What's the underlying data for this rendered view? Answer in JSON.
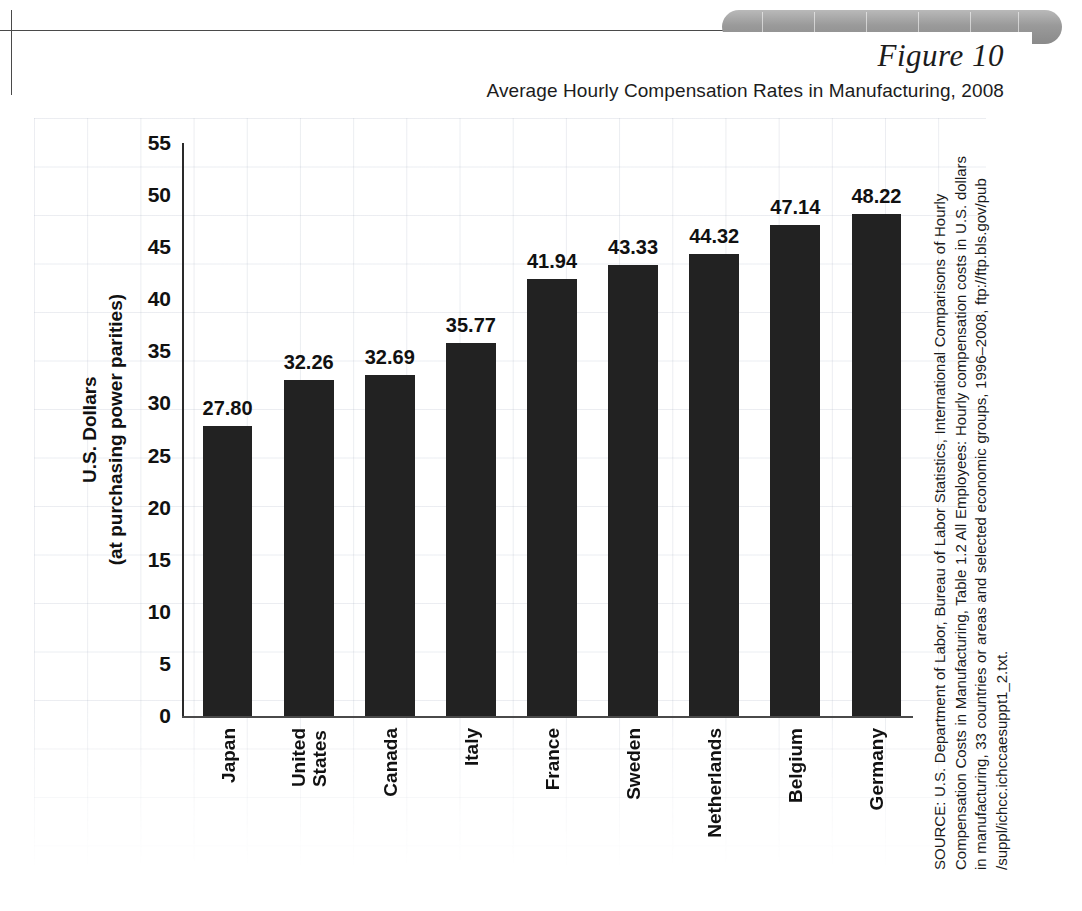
{
  "figure": {
    "label": "Figure 10",
    "title": "Average Hourly Compensation Rates in Manufacturing, 2008"
  },
  "source": {
    "text": "SOURCE: U.S. Department of Labor, Bureau of Labor Statistics, International Comparisons of Hourly Compensation Costs in Manufacturing, Table 1.2 All Employees: Hourly compensation costs in U.S. dollars in manufacturing, 33 countries or areas and selected economic groups, 1996–2008, ftp://ftp.bls.gov/pub /suppl/ichcc.ichccaesuppt1_2.txt."
  },
  "colors": {
    "bar": "#222222",
    "axis": "#2a2a2a",
    "text": "#111111",
    "grid": "#96a0b4",
    "tab": "#9a9a9a"
  },
  "chart_data": {
    "type": "bar",
    "title": "Average Hourly Compensation Rates in Manufacturing, 2008",
    "xlabel": "",
    "ylabel": "U.S. Dollars (at purchasing power parities)",
    "ylabel_line1": "U.S. Dollars",
    "ylabel_line2": "(at purchasing power parities)",
    "ylim": [
      0,
      55
    ],
    "ytick_step": 5,
    "yticks": [
      55,
      50,
      45,
      40,
      35,
      30,
      25,
      20,
      15,
      10,
      5,
      0
    ],
    "grid": false,
    "legend": false,
    "categories": [
      "Japan",
      "United States",
      "Canada",
      "Italy",
      "France",
      "Sweden",
      "Netherlands",
      "Belgium",
      "Germany"
    ],
    "category_lines": [
      [
        "Japan"
      ],
      [
        "United",
        "States"
      ],
      [
        "Canada"
      ],
      [
        "Italy"
      ],
      [
        "France"
      ],
      [
        "Sweden"
      ],
      [
        "Netherlands"
      ],
      [
        "Belgium"
      ],
      [
        "Germany"
      ]
    ],
    "values": [
      27.8,
      32.26,
      32.69,
      35.77,
      41.94,
      43.33,
      44.32,
      47.14,
      48.22
    ],
    "value_labels": [
      "27.80",
      "32.26",
      "32.69",
      "35.77",
      "41.94",
      "43.33",
      "44.32",
      "47.14",
      "48.22"
    ]
  }
}
